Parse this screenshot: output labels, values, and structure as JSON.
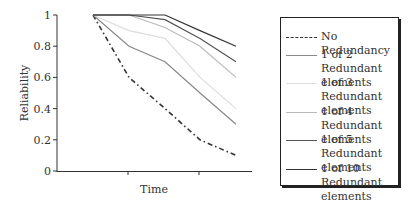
{
  "chart_data": {
    "type": "line",
    "title": "",
    "xlabel": "Time",
    "ylabel": "Reliability",
    "ylim": [
      0,
      1
    ],
    "yticks": [
      "0",
      "0.2",
      "0.4",
      "0.6",
      "0.8",
      "1"
    ],
    "x": [
      0,
      1,
      2,
      3,
      4
    ],
    "x_ticks_labeled": false,
    "grid": false,
    "legend_position": "right",
    "series": [
      {
        "name": "No Redundancy",
        "values": [
          1.0,
          0.6,
          0.4,
          0.2,
          0.1
        ],
        "color": "#333333",
        "style": "dash-dot"
      },
      {
        "name": "1 of 2 Redundant elements",
        "values": [
          1.0,
          0.8,
          0.7,
          0.5,
          0.3
        ],
        "color": "#888888",
        "style": "solid"
      },
      {
        "name": "1 of 3 Redundant elements",
        "values": [
          1.0,
          0.9,
          0.85,
          0.6,
          0.4
        ],
        "color": "#dddddd",
        "style": "solid"
      },
      {
        "name": "1 of 4 Redundant elements",
        "values": [
          1.0,
          1.0,
          0.92,
          0.8,
          0.6
        ],
        "color": "#bbbbbb",
        "style": "solid"
      },
      {
        "name": "1 of 5 Redundant elements",
        "values": [
          1.0,
          1.0,
          0.97,
          0.85,
          0.7
        ],
        "color": "#555555",
        "style": "solid"
      },
      {
        "name": "1 of 10 Redundant elements",
        "values": [
          1.0,
          1.0,
          1.0,
          0.9,
          0.8
        ],
        "color": "#333333",
        "style": "solid"
      }
    ]
  },
  "legend": {
    "items": [
      {
        "label": "No Redundancy"
      },
      {
        "label": "1 of 2 Redundant elements"
      },
      {
        "label": "1 of 3 Redundant elements"
      },
      {
        "label": "1 of 4 Redundant elements"
      },
      {
        "label": "1 of 5 Redundant elements"
      },
      {
        "label": "1 of 10 Redundant elements"
      }
    ]
  }
}
